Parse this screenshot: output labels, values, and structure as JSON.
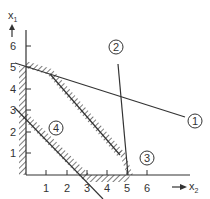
{
  "diagram": {
    "type": "linear-programming-feasible-region",
    "axes": {
      "x_label": "x",
      "x_sub": "2",
      "y_label": "x",
      "y_sub": "1",
      "x_ticks": [
        "1",
        "2",
        "3",
        "4",
        "5",
        "6"
      ],
      "y_ticks": [
        "1",
        "2",
        "3",
        "4",
        "5",
        "6"
      ]
    },
    "constraints": [
      {
        "id": "1",
        "label": "1"
      },
      {
        "id": "2",
        "label": "2"
      },
      {
        "id": "3",
        "label": "3"
      },
      {
        "id": "4",
        "label": "4"
      }
    ]
  }
}
